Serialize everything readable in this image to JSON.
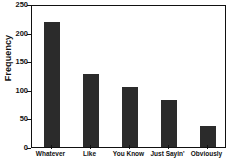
{
  "chart_data": {
    "type": "bar",
    "title": "",
    "xlabel": "",
    "ylabel": "Frequency",
    "categories": [
      "Whatever",
      "Like",
      "You Know",
      "Just Sayin'",
      "Obviously"
    ],
    "values": [
      218,
      128,
      105,
      82,
      36
    ],
    "ylim": [
      0,
      250
    ],
    "yticks": [
      0,
      50,
      100,
      150,
      200,
      250
    ],
    "ytick_labels": [
      "0",
      "50",
      "100",
      "150",
      "200",
      "250"
    ],
    "grid": false,
    "legend": false,
    "bar_color": "#2b2b2b",
    "axis_color": "#111111",
    "background_color": "#ffffff"
  }
}
